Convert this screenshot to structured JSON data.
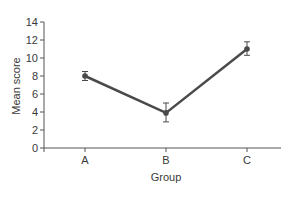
{
  "chart_data": {
    "type": "line",
    "title": "",
    "xlabel": "Group",
    "ylabel": "Mean score",
    "categories": [
      "A",
      "B",
      "C"
    ],
    "series": [
      {
        "name": "Mean score",
        "values": [
          8.0,
          3.9,
          11.0
        ],
        "error_low": [
          7.5,
          2.9,
          10.3
        ],
        "error_high": [
          8.5,
          5.0,
          11.8
        ]
      }
    ],
    "ylim": [
      0,
      14
    ],
    "yticks": [
      0,
      2,
      4,
      6,
      8,
      10,
      12,
      14
    ],
    "grid": false,
    "legend": "none",
    "line_color": "#4a4a4a"
  }
}
